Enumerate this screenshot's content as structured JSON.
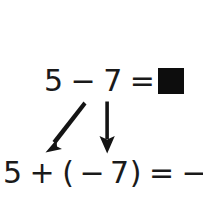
{
  "figure": {
    "background_color": "#ffffff",
    "ink_color": "#1a1a1a",
    "box_color": "#0d0d0d"
  },
  "equation_top": {
    "full_text": "5 − 7 = ",
    "operand_left": "5",
    "operator": "−",
    "operand_right": "7",
    "equals": "=",
    "answer_placeholder": "blank-black-square"
  },
  "equation_bottom": {
    "full_text": "5 + (−7) = −2",
    "operand_left": "5",
    "operator": "+",
    "open_paren": "(",
    "negative_sign": "−",
    "operand_right": "7",
    "close_paren": ")",
    "equals": "=",
    "result": "−2"
  },
  "arrows": [
    {
      "name": "diagonal-arrow",
      "label": "minus-to-negative-seven",
      "direction": "down-left",
      "from": [
        83,
        102
      ],
      "to": [
        47,
        152
      ]
    },
    {
      "name": "vertical-arrow",
      "label": "seven-to-seven",
      "direction": "down",
      "from": [
        107,
        102
      ],
      "to": [
        107,
        152
      ]
    }
  ]
}
